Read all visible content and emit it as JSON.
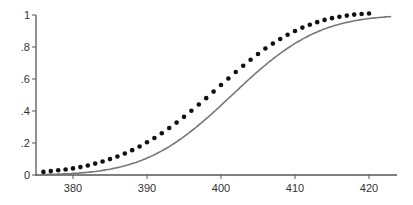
{
  "chart_data": {
    "type": "scatter",
    "title": "",
    "xlabel": "",
    "ylabel": "",
    "xlim": [
      375,
      424
    ],
    "ylim": [
      0,
      1
    ],
    "x_ticks": [
      380,
      390,
      400,
      410,
      420
    ],
    "x_tick_labels": [
      "380",
      "390",
      "400",
      "410",
      "420"
    ],
    "y_ticks": [
      0,
      0.2,
      0.4,
      0.6,
      0.8,
      1
    ],
    "y_tick_labels": [
      "0",
      ".2",
      ".4",
      ".6",
      ".8",
      "1"
    ],
    "grid": false,
    "series": [
      {
        "name": "empirical",
        "kind": "points",
        "x": [
          376,
          377,
          378,
          379,
          380,
          381,
          382,
          383,
          384,
          385,
          386,
          387,
          388,
          389,
          390,
          391,
          392,
          393,
          394,
          395,
          396,
          397,
          398,
          399,
          400,
          401,
          402,
          403,
          404,
          405,
          406,
          407,
          408,
          409,
          410,
          411,
          412,
          413,
          414,
          415,
          416,
          417,
          418,
          419,
          420
        ],
        "y": [
          0.01,
          0.015,
          0.02,
          0.025,
          0.032,
          0.04,
          0.05,
          0.062,
          0.075,
          0.09,
          0.106,
          0.125,
          0.146,
          0.169,
          0.195,
          0.222,
          0.252,
          0.284,
          0.318,
          0.354,
          0.392,
          0.431,
          0.471,
          0.512,
          0.553,
          0.594,
          0.634,
          0.673,
          0.711,
          0.747,
          0.781,
          0.812,
          0.841,
          0.867,
          0.891,
          0.912,
          0.93,
          0.946,
          0.96,
          0.971,
          0.98,
          0.987,
          0.993,
          0.997,
          1.0
        ]
      },
      {
        "name": "normal fit",
        "kind": "line",
        "mean": 401.5,
        "sd": 9.2,
        "x_range": [
          376,
          423
        ]
      }
    ]
  }
}
